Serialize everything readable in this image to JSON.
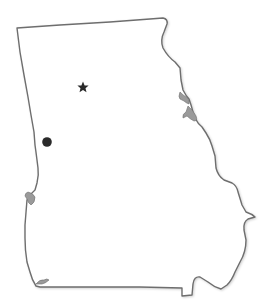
{
  "map": {
    "region": "Georgia (U.S. state)",
    "style": "outline map, no labels",
    "colors": {
      "background": "#ffffff",
      "outline_stroke": "#6e6e6e",
      "fill": "#ffffff",
      "marker": "#2a2a2a",
      "lakes": "#9a9a9a"
    },
    "markers": [
      {
        "type": "star",
        "symbol": "★",
        "x": 83,
        "y": 87,
        "meaning": "capital marker"
      },
      {
        "type": "dot",
        "symbol": "●",
        "x": 47,
        "y": 142,
        "meaning": "city marker"
      }
    ],
    "labels": []
  }
}
